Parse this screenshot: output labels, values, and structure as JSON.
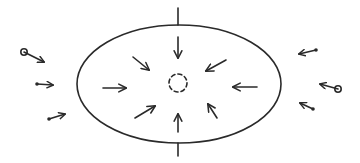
{
  "diagram": {
    "description": "Hand-drawn sketch of an elliptical region with a vertical axis line; arrows inside point inward toward a dashed central circle; small particles outside move toward the ellipse",
    "colors": {
      "ink": "#2a2a2a",
      "background": "#ffffff"
    },
    "ellipse": {
      "cx": 179,
      "cy": 84,
      "rx": 102,
      "ry": 59
    },
    "axis_line": {
      "x": 178,
      "top": [
        8,
        25
      ],
      "bottom": [
        143,
        156
      ]
    },
    "center_circle": {
      "cx": 178,
      "cy": 83,
      "r": 9,
      "style": "dashed"
    },
    "inner_arrows": [
      {
        "name": "top",
        "from": [
          178,
          37
        ],
        "to": [
          178,
          58
        ]
      },
      {
        "name": "upper-left",
        "from": [
          133,
          57
        ],
        "to": [
          149,
          70
        ]
      },
      {
        "name": "left",
        "from": [
          103,
          88
        ],
        "to": [
          126,
          88
        ]
      },
      {
        "name": "lower-left",
        "from": [
          135,
          118
        ],
        "to": [
          155,
          106
        ]
      },
      {
        "name": "bottom",
        "from": [
          178,
          132
        ],
        "to": [
          178,
          114
        ]
      },
      {
        "name": "lower-right",
        "from": [
          217,
          118
        ],
        "to": [
          208,
          104
        ]
      },
      {
        "name": "right",
        "from": [
          257,
          87
        ],
        "to": [
          233,
          87
        ]
      },
      {
        "name": "upper-right",
        "from": [
          226,
          60
        ],
        "to": [
          206,
          71
        ]
      }
    ],
    "outer_particles": [
      {
        "side": "left",
        "shape": "open-circle",
        "at": [
          24,
          52
        ],
        "arrow_to": [
          44,
          62
        ]
      },
      {
        "side": "left",
        "shape": "dot",
        "at": [
          37,
          84
        ],
        "arrow_to": [
          53,
          85
        ]
      },
      {
        "side": "left",
        "shape": "dot",
        "at": [
          49,
          119
        ],
        "arrow_to": [
          65,
          114
        ]
      },
      {
        "side": "right",
        "shape": "dot",
        "at": [
          316,
          50
        ],
        "arrow_to": [
          299,
          54
        ]
      },
      {
        "side": "right",
        "shape": "open-circle",
        "at": [
          338,
          89
        ],
        "arrow_to": [
          320,
          84
        ]
      },
      {
        "side": "right",
        "shape": "dot",
        "at": [
          313,
          109
        ],
        "arrow_to": [
          300,
          103
        ]
      }
    ]
  }
}
